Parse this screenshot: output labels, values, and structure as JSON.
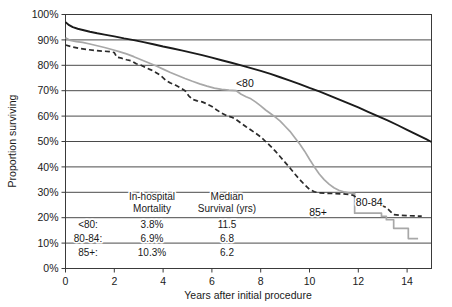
{
  "chart_data": {
    "type": "line",
    "title": "",
    "subtitle": "",
    "xlabel": "Years after initial procedure",
    "ylabel": "Proportion surviving",
    "xlim": [
      0,
      15
    ],
    "ylim": [
      0,
      1
    ],
    "grid": "horizontal",
    "legend_position": "inline-annotations",
    "xticks": [
      0,
      2,
      4,
      6,
      8,
      10,
      12,
      14
    ],
    "xtick_labels": [
      "0",
      "2",
      "4",
      "6",
      "8",
      "10",
      "12",
      "14"
    ],
    "yticks": [
      0,
      0.1,
      0.2,
      0.3,
      0.4,
      0.5,
      0.6,
      0.7,
      0.8,
      0.9,
      1.0
    ],
    "ytick_labels": [
      "0%",
      "10%",
      "20%",
      "30%",
      "40%",
      "50%",
      "60%",
      "70%",
      "80%",
      "90%",
      "100%"
    ],
    "series": [
      {
        "name": "<80",
        "label": "<80",
        "color": "#1b1b1b",
        "style": "solid",
        "width": 1.9,
        "label_x": 7.35,
        "label_y": 0.715,
        "points": [
          [
            0.0,
            0.97
          ],
          [
            0.15,
            0.958
          ],
          [
            0.3,
            0.95
          ],
          [
            0.5,
            0.944
          ],
          [
            0.75,
            0.938
          ],
          [
            1.0,
            0.932
          ],
          [
            1.3,
            0.926
          ],
          [
            1.6,
            0.921
          ],
          [
            2.0,
            0.914
          ],
          [
            2.4,
            0.906
          ],
          [
            2.8,
            0.899
          ],
          [
            3.2,
            0.891
          ],
          [
            3.6,
            0.883
          ],
          [
            4.0,
            0.874
          ],
          [
            4.4,
            0.866
          ],
          [
            4.8,
            0.858
          ],
          [
            5.2,
            0.849
          ],
          [
            5.6,
            0.84
          ],
          [
            6.0,
            0.83
          ],
          [
            6.4,
            0.82
          ],
          [
            6.8,
            0.81
          ],
          [
            7.2,
            0.8
          ],
          [
            7.6,
            0.789
          ],
          [
            8.0,
            0.778
          ],
          [
            8.4,
            0.766
          ],
          [
            8.8,
            0.753
          ],
          [
            9.2,
            0.74
          ],
          [
            9.6,
            0.726
          ],
          [
            10.0,
            0.711
          ],
          [
            10.4,
            0.697
          ],
          [
            10.8,
            0.682
          ],
          [
            11.2,
            0.666
          ],
          [
            11.6,
            0.65
          ],
          [
            12.0,
            0.634
          ],
          [
            12.4,
            0.617
          ],
          [
            12.8,
            0.6
          ],
          [
            13.2,
            0.583
          ],
          [
            13.6,
            0.565
          ],
          [
            14.0,
            0.546
          ],
          [
            14.4,
            0.527
          ],
          [
            14.8,
            0.508
          ],
          [
            15.0,
            0.498
          ]
        ]
      },
      {
        "name": "85+",
        "label": "85+",
        "color": "#a8a8a8",
        "style": "solid",
        "width": 1.7,
        "label_x": 10.35,
        "label_y": 0.205,
        "points": [
          [
            0.0,
            0.908
          ],
          [
            0.2,
            0.898
          ],
          [
            0.45,
            0.893
          ],
          [
            0.7,
            0.89
          ],
          [
            1.0,
            0.884
          ],
          [
            1.3,
            0.877
          ],
          [
            1.6,
            0.87
          ],
          [
            1.9,
            0.862
          ],
          [
            2.2,
            0.854
          ],
          [
            2.5,
            0.845
          ],
          [
            2.8,
            0.834
          ],
          [
            3.1,
            0.822
          ],
          [
            3.4,
            0.81
          ],
          [
            3.7,
            0.798
          ],
          [
            4.0,
            0.785
          ],
          [
            4.3,
            0.772
          ],
          [
            4.6,
            0.76
          ],
          [
            4.9,
            0.748
          ],
          [
            5.2,
            0.737
          ],
          [
            5.5,
            0.727
          ],
          [
            5.8,
            0.718
          ],
          [
            6.1,
            0.71
          ],
          [
            6.4,
            0.705
          ],
          [
            6.7,
            0.702
          ],
          [
            7.0,
            0.7
          ],
          [
            7.2,
            0.686
          ],
          [
            7.4,
            0.676
          ],
          [
            7.6,
            0.668
          ],
          [
            7.8,
            0.655
          ],
          [
            8.0,
            0.64
          ],
          [
            8.2,
            0.624
          ],
          [
            8.4,
            0.61
          ],
          [
            8.6,
            0.596
          ],
          [
            8.8,
            0.58
          ],
          [
            9.0,
            0.56
          ],
          [
            9.2,
            0.54
          ],
          [
            9.4,
            0.515
          ],
          [
            9.6,
            0.49
          ],
          [
            9.8,
            0.462
          ],
          [
            10.0,
            0.43
          ],
          [
            10.2,
            0.4
          ],
          [
            10.4,
            0.372
          ],
          [
            10.6,
            0.35
          ],
          [
            10.8,
            0.332
          ],
          [
            11.0,
            0.318
          ],
          [
            11.2,
            0.308
          ],
          [
            11.4,
            0.302
          ],
          [
            11.6,
            0.298
          ],
          [
            11.8,
            0.296
          ],
          [
            11.85,
            0.296
          ],
          [
            11.85,
            0.218
          ],
          [
            12.95,
            0.218
          ],
          [
            12.95,
            0.205
          ],
          [
            13.15,
            0.205
          ],
          [
            13.15,
            0.192
          ],
          [
            13.45,
            0.192
          ],
          [
            13.45,
            0.158
          ],
          [
            14.05,
            0.158
          ],
          [
            14.05,
            0.118
          ],
          [
            14.45,
            0.118
          ]
        ]
      },
      {
        "name": "80-84",
        "label": "80-84",
        "color": "#2b2b2b",
        "style": "dashed",
        "width": 1.7,
        "dash": "5,3",
        "label_x": 12.45,
        "label_y": 0.248,
        "points": [
          [
            0.0,
            0.88
          ],
          [
            0.3,
            0.872
          ],
          [
            0.6,
            0.866
          ],
          [
            0.9,
            0.862
          ],
          [
            1.2,
            0.858
          ],
          [
            1.5,
            0.856
          ],
          [
            1.8,
            0.854
          ],
          [
            2.0,
            0.85
          ],
          [
            2.1,
            0.832
          ],
          [
            2.3,
            0.828
          ],
          [
            2.5,
            0.822
          ],
          [
            2.7,
            0.818
          ],
          [
            2.9,
            0.806
          ],
          [
            3.1,
            0.8
          ],
          [
            3.3,
            0.79
          ],
          [
            3.5,
            0.782
          ],
          [
            3.7,
            0.772
          ],
          [
            3.9,
            0.76
          ],
          [
            4.1,
            0.742
          ],
          [
            4.3,
            0.73
          ],
          [
            4.5,
            0.722
          ],
          [
            4.7,
            0.712
          ],
          [
            4.9,
            0.7
          ],
          [
            5.05,
            0.68
          ],
          [
            5.2,
            0.666
          ],
          [
            5.4,
            0.66
          ],
          [
            5.6,
            0.656
          ],
          [
            5.8,
            0.648
          ],
          [
            6.0,
            0.638
          ],
          [
            6.2,
            0.624
          ],
          [
            6.4,
            0.612
          ],
          [
            6.6,
            0.602
          ],
          [
            6.8,
            0.596
          ],
          [
            7.0,
            0.586
          ],
          [
            7.2,
            0.572
          ],
          [
            7.4,
            0.558
          ],
          [
            7.6,
            0.545
          ],
          [
            7.8,
            0.532
          ],
          [
            8.0,
            0.518
          ],
          [
            8.2,
            0.5
          ],
          [
            8.4,
            0.482
          ],
          [
            8.6,
            0.462
          ],
          [
            8.8,
            0.44
          ],
          [
            9.0,
            0.418
          ],
          [
            9.2,
            0.396
          ],
          [
            9.4,
            0.372
          ],
          [
            9.6,
            0.35
          ],
          [
            9.8,
            0.33
          ],
          [
            10.0,
            0.312
          ],
          [
            10.2,
            0.302
          ],
          [
            10.4,
            0.298
          ],
          [
            10.7,
            0.296
          ],
          [
            11.0,
            0.295
          ],
          [
            11.3,
            0.294
          ],
          [
            11.6,
            0.292
          ],
          [
            11.8,
            0.288
          ],
          [
            11.9,
            0.28
          ],
          [
            12.05,
            0.272
          ],
          [
            12.2,
            0.266
          ],
          [
            12.35,
            0.262
          ],
          [
            12.55,
            0.258
          ],
          [
            12.75,
            0.252
          ],
          [
            12.95,
            0.248
          ],
          [
            13.15,
            0.24
          ],
          [
            13.3,
            0.226
          ],
          [
            13.45,
            0.212
          ],
          [
            13.7,
            0.21
          ],
          [
            14.0,
            0.208
          ],
          [
            14.3,
            0.207
          ],
          [
            14.6,
            0.206
          ]
        ]
      }
    ],
    "inline_table": {
      "headers": [
        "",
        "In-hospital\nMortality",
        "Median\nSurvival (yrs)"
      ],
      "header_col2_line1": "In-hospital",
      "header_col2_line2": "Mortality",
      "header_col3_line1": "Median",
      "header_col3_line2": "Survival (yrs)",
      "rows": [
        {
          "group": "<80:",
          "mortality": "3.8%",
          "median_survival": "11.5"
        },
        {
          "group": "80-84:",
          "mortality": "6.9%",
          "median_survival": "6.8"
        },
        {
          "group": "85+:",
          "mortality": "10.3%",
          "median_survival": "6.2"
        }
      ]
    },
    "colors": {
      "under80": "#1b1b1b",
      "age80_84": "#2b2b2b",
      "age85plus": "#a8a8a8",
      "gridline": "#4a4a4a",
      "axis": "#3a3a3a",
      "background": "#ffffff"
    }
  }
}
